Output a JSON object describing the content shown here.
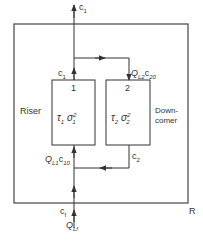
{
  "diagram": {
    "outer_box_label": "R",
    "riser": {
      "label": "Riser",
      "number": "1",
      "tau": "τ",
      "tau_sub": "1",
      "sigma": "σ",
      "sigma_sub": "1",
      "sigma_sup": "2"
    },
    "downcomer": {
      "label_line1": "Down-",
      "label_line2": "comer",
      "number": "2",
      "tau": "τ",
      "tau_sub": "2",
      "sigma": "σ",
      "sigma_sub": "2",
      "sigma_sup": "2"
    },
    "streams": {
      "top_out": {
        "base": "c",
        "sub": "1"
      },
      "riser_out": {
        "base": "c",
        "sub": "1"
      },
      "to_downcomer": {
        "q": "Q",
        "q_sub": "L2",
        "c": "c",
        "c_sub": "20"
      },
      "downcomer_out": {
        "base": "c",
        "sub": "2"
      },
      "to_riser": {
        "q": "Q",
        "q_sub": "L1",
        "c": "c",
        "c_sub": "10"
      },
      "feed_c": {
        "base": "c",
        "sub": "f"
      },
      "feed_q": {
        "base": "Q",
        "sub": "Lf"
      }
    },
    "colors": {
      "line": "#333333",
      "background": "#ffffff"
    }
  }
}
